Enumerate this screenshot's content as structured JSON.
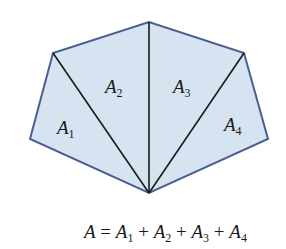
{
  "diagram": {
    "fill_color": "#d6e4f2",
    "outline_color": "#4a5e93",
    "diagonal_color": "#1a1a1a",
    "vertices": {
      "left": [
        30,
        139
      ],
      "top_left": [
        53,
        53
      ],
      "top": [
        149,
        22
      ],
      "top_right": [
        244,
        53
      ],
      "right": [
        268,
        139
      ],
      "bottom": [
        149,
        193
      ]
    },
    "regions": [
      {
        "base": "A",
        "sub": "1"
      },
      {
        "base": "A",
        "sub": "2"
      },
      {
        "base": "A",
        "sub": "3"
      },
      {
        "base": "A",
        "sub": "4"
      }
    ],
    "formula": {
      "lhs": "A",
      "eq": " = ",
      "terms": [
        {
          "base": "A",
          "sub": "1"
        },
        {
          "base": "A",
          "sub": "2"
        },
        {
          "base": "A",
          "sub": "3"
        },
        {
          "base": "A",
          "sub": "4"
        }
      ],
      "plus": " + "
    }
  }
}
